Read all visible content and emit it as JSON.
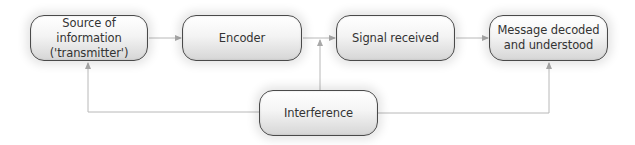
{
  "diagram": {
    "type": "communication-process-flow",
    "nodes": [
      {
        "id": "source",
        "lines": [
          "Source of information",
          "('transmitter')"
        ]
      },
      {
        "id": "encoder",
        "lines": [
          "Encoder"
        ]
      },
      {
        "id": "signal",
        "lines": [
          "Signal received"
        ]
      },
      {
        "id": "message",
        "lines": [
          "Message decoded",
          "and understood"
        ]
      },
      {
        "id": "interference",
        "lines": [
          "Interference"
        ]
      }
    ],
    "edges": [
      {
        "from": "source",
        "to": "encoder"
      },
      {
        "from": "encoder",
        "to": "signal"
      },
      {
        "from": "signal",
        "to": "message"
      },
      {
        "from": "interference",
        "to": "source"
      },
      {
        "from": "interference",
        "to": "encoder-signal-link"
      },
      {
        "from": "interference",
        "to": "message"
      }
    ],
    "colors": {
      "box_border": "#4a4a4a",
      "box_fill_top": "#ffffff",
      "box_fill_bottom": "#d6d6d6",
      "text": "#333333",
      "connector": "#b8b8b8"
    }
  }
}
